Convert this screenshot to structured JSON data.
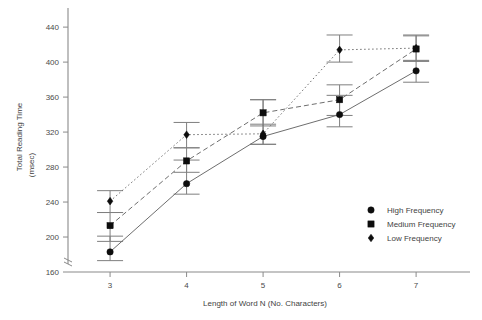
{
  "chart_data": {
    "type": "line",
    "title": "",
    "xlabel": "Length of Word N (No. Characters)",
    "ylabel": "Total Reading Time",
    "ylabel_unit": "(msec)",
    "x": [
      3,
      4,
      5,
      6,
      7
    ],
    "xticklabels": [
      "3",
      "4",
      "5",
      "6",
      "7"
    ],
    "yticklabels": [
      "160",
      "200",
      "240",
      "280",
      "320",
      "360",
      "400",
      "440"
    ],
    "yticks": [
      160,
      200,
      240,
      280,
      320,
      360,
      400,
      440
    ],
    "ylim": [
      160,
      455
    ],
    "xlim": [
      2.45,
      7.6
    ],
    "grid": false,
    "axis_break": true,
    "legend_position": "lower-right",
    "series": [
      {
        "name": "High Frequency",
        "marker": "circle",
        "linestyle": "solid",
        "values": [
          183,
          261,
          315,
          340,
          390
        ],
        "err_upper": [
          201,
          288,
          329,
          362,
          402
        ],
        "err_lower": [
          173,
          249,
          306,
          326,
          377
        ]
      },
      {
        "name": "Medium Frequency",
        "marker": "square",
        "linestyle": "dashed",
        "values": [
          213,
          287,
          342,
          357,
          415
        ],
        "err_upper": [
          228,
          302,
          357,
          374,
          430
        ],
        "err_lower": [
          195,
          274,
          327,
          339,
          401
        ]
      },
      {
        "name": "Low Frequency",
        "marker": "diamond",
        "linestyle": "dotted",
        "values": [
          241,
          317,
          318,
          414,
          416
        ],
        "err_upper": [
          253,
          331,
          357,
          431,
          431
        ],
        "err_lower": [
          228,
          302,
          306,
          400,
          401
        ]
      }
    ]
  },
  "legend": {
    "items": [
      {
        "label": "High Frequency",
        "marker": "circle"
      },
      {
        "label": "Medium Frequency",
        "marker": "square"
      },
      {
        "label": "Low Frequency",
        "marker": "diamond"
      }
    ]
  },
  "colors": {
    "axis": "#8a8a8a",
    "marker": "#0d0d0d",
    "line": "#6e6e6e",
    "errorbar": "#7f7f7f",
    "text": "#3f3f3f",
    "background": "#ffffff"
  }
}
